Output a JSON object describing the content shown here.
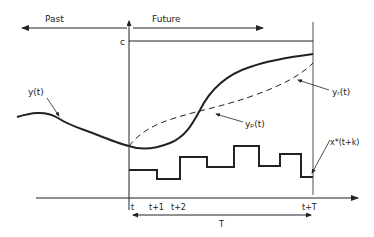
{
  "labels": {
    "past": "Past",
    "future": "Future",
    "c": "c",
    "y": "y(t)",
    "yr": "yᵣ(t)",
    "yp": "yₚ(t)",
    "x_star": "x*(t+k)",
    "tick_t": "t",
    "tick_t1": "t+1",
    "tick_t2": "t+2",
    "tick_tT": "t+T",
    "horizon": "T"
  },
  "colors": {
    "ink": "#222222",
    "background": "#ffffff"
  }
}
